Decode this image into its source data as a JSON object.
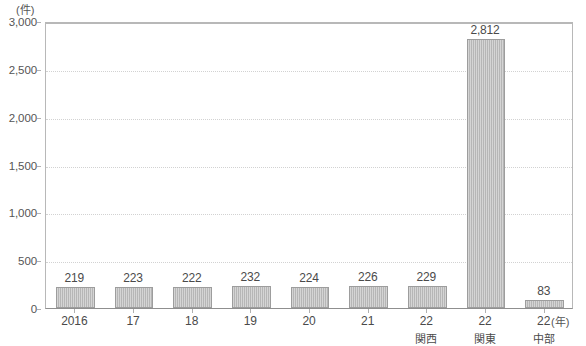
{
  "chart_data": {
    "type": "bar",
    "title": "",
    "subtitle": "",
    "xlabel": "(年)",
    "ylabel": "(件)",
    "ylim": [
      0,
      3000
    ],
    "ytick_step": 500,
    "grid": true,
    "legend": null,
    "categories": [
      "2016",
      "17",
      "18",
      "19",
      "20",
      "21",
      "22",
      "22",
      "22"
    ],
    "category_sublabels": [
      "",
      "",
      "",
      "",
      "",
      "",
      "関西",
      "関東",
      "中部"
    ],
    "values": [
      219,
      223,
      222,
      232,
      224,
      226,
      229,
      2812,
      83
    ],
    "value_labels": [
      "219",
      "223",
      "222",
      "232",
      "224",
      "226",
      "229",
      "2,812",
      "83"
    ],
    "ytick_labels": [
      "3,000",
      "2,500",
      "2,000",
      "1,500",
      "1,000",
      "500",
      "0"
    ],
    "ytick_values": [
      3000,
      2500,
      2000,
      1500,
      1000,
      500,
      0
    ],
    "colors": {
      "bar_fill": "#b6b6b6",
      "bar_border": "#9d9d9d",
      "gridline": "#d2d2d2",
      "axis": "#8f8f8f",
      "text": "#4a4a4a"
    }
  }
}
